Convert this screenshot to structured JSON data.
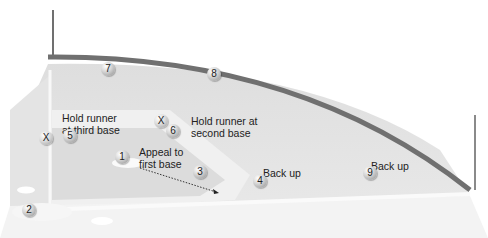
{
  "diagram": {
    "type": "baseball-field-fielder-positions",
    "colors": {
      "fence": "#707070",
      "field_light": "#e6e6e6",
      "field_mid": "#d6d6d6",
      "basepath": "#f4f4f4"
    },
    "fielders": [
      {
        "number": "1",
        "x": 122,
        "y": 157
      },
      {
        "number": "2",
        "x": 29,
        "y": 210
      },
      {
        "number": "3",
        "x": 200,
        "y": 172
      },
      {
        "number": "4",
        "x": 260,
        "y": 181
      },
      {
        "number": "5",
        "x": 70,
        "y": 136
      },
      {
        "number": "6",
        "x": 173,
        "y": 131
      },
      {
        "number": "7",
        "x": 108,
        "y": 69
      },
      {
        "number": "8",
        "x": 214,
        "y": 74
      },
      {
        "number": "9",
        "x": 370,
        "y": 173
      }
    ],
    "runners": [
      {
        "symbol": "X",
        "x": 46,
        "y": 138
      },
      {
        "symbol": "X",
        "x": 161,
        "y": 121
      }
    ],
    "labels": [
      {
        "id": "hold-third",
        "text_line1": "Hold runner",
        "text_line2": "at third base",
        "x": 62,
        "y": 112
      },
      {
        "id": "hold-second",
        "text_line1": "Hold runner at",
        "text_line2": "second base",
        "x": 191,
        "y": 115
      },
      {
        "id": "appeal-first",
        "text_line1": "Appeal to",
        "text_line2": "first base",
        "x": 139,
        "y": 146
      },
      {
        "id": "backup-4",
        "text_line1": "Back up",
        "text_line2": "",
        "x": 263,
        "y": 167
      },
      {
        "id": "backup-9",
        "text_line1": "Back up",
        "text_line2": "",
        "x": 371,
        "y": 160
      }
    ]
  }
}
